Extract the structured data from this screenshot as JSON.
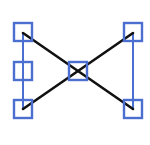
{
  "icon": {
    "name": "selected-connector-graph-icon",
    "colors": {
      "selection": "#4a6fd0",
      "connector": "#111111",
      "background": "#ffffff"
    }
  },
  "nodes": [
    {
      "id": "top-left",
      "x": 14,
      "y": 23,
      "size": 18
    },
    {
      "id": "middle-left",
      "x": 14,
      "y": 62,
      "size": 18
    },
    {
      "id": "bottom-left",
      "x": 14,
      "y": 100,
      "size": 18
    },
    {
      "id": "center",
      "x": 69,
      "y": 62,
      "size": 18
    },
    {
      "id": "top-right",
      "x": 124,
      "y": 23,
      "size": 18
    },
    {
      "id": "bottom-right",
      "x": 124,
      "y": 100,
      "size": 18
    }
  ],
  "selection_lines": [
    {
      "id": "left-vertical",
      "x1": 23,
      "y1": 32,
      "x2": 23,
      "y2": 109
    },
    {
      "id": "right-vertical",
      "x1": 133,
      "y1": 32,
      "x2": 133,
      "y2": 109
    }
  ],
  "connectors": [
    {
      "id": "diagonal-down",
      "x1": 23,
      "y1": 33,
      "x2": 133,
      "y2": 109
    },
    {
      "id": "diagonal-up",
      "x1": 23,
      "y1": 109,
      "x2": 133,
      "y2": 33
    }
  ]
}
